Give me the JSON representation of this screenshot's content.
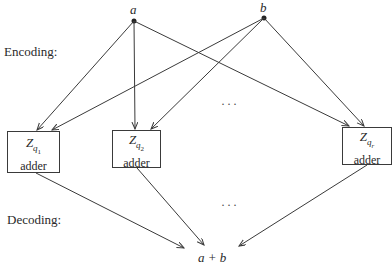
{
  "sections": {
    "encoding_label": "Encoding:",
    "decoding_label": "Decoding:"
  },
  "inputs": {
    "a": {
      "label": "a",
      "x": 134,
      "y": 21
    },
    "b": {
      "label": "b",
      "x": 264,
      "y": 18
    }
  },
  "adders": [
    {
      "z": "Z",
      "q": "q",
      "sub": "1",
      "label": "adder",
      "left": 7,
      "top": 131,
      "width": 53,
      "height": 42
    },
    {
      "z": "Z",
      "q": "q",
      "sub": "2",
      "label": "adder",
      "left": 112,
      "top": 130,
      "width": 49,
      "height": 38
    },
    {
      "z": "Z",
      "q": "q",
      "sub": "r",
      "label": "adder",
      "left": 342,
      "top": 127,
      "width": 50,
      "height": 38
    }
  ],
  "ellipsis": {
    "encoding": "···",
    "decoding": "···"
  },
  "output": {
    "label": "a + b"
  },
  "colors": {
    "line": "#3a3a3a",
    "text": "#2a2a2a"
  }
}
